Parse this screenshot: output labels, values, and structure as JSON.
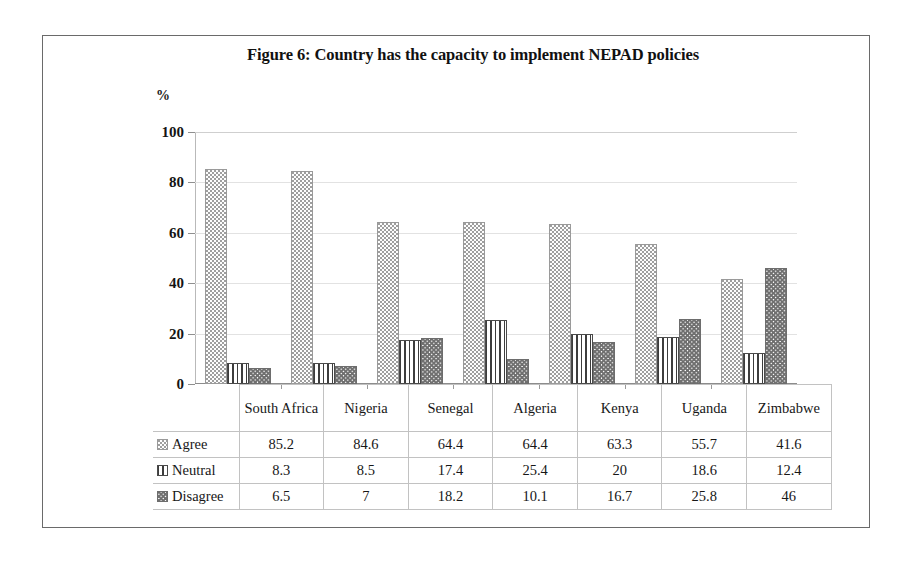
{
  "figure": {
    "title": "Figure 6: Country has the capacity to implement NEPAD policies",
    "y_axis_unit_label": "%"
  },
  "legend": {
    "items": [
      {
        "label": "Agree",
        "pattern": "stipple-dots",
        "swatch": "agree-swatch-icon"
      },
      {
        "label": "Neutral",
        "pattern": "vertical-stripes",
        "swatch": "neutral-swatch-icon"
      },
      {
        "label": "Disagree",
        "pattern": "wave-crosshatch",
        "swatch": "disagree-swatch-icon"
      }
    ]
  },
  "chart_data": {
    "type": "bar",
    "title": "Figure 6: Country has the capacity to implement NEPAD policies",
    "xlabel": "",
    "ylabel": "%",
    "ylim": [
      0,
      100
    ],
    "yticks": [
      0,
      20,
      40,
      60,
      80,
      100
    ],
    "grid": true,
    "legend_position": "table-row-headers",
    "categories": [
      "South Africa",
      "Nigeria",
      "Senegal",
      "Algeria",
      "Kenya",
      "Uganda",
      "Zimbabwe"
    ],
    "series": [
      {
        "name": "Agree",
        "values": [
          85.2,
          84.6,
          64.4,
          64.4,
          63.3,
          55.7,
          41.6
        ]
      },
      {
        "name": "Neutral",
        "values": [
          8.3,
          8.5,
          17.4,
          25.4,
          20,
          18.6,
          12.4
        ]
      },
      {
        "name": "Disagree",
        "values": [
          6.5,
          7,
          18.2,
          10.1,
          16.7,
          25.8,
          46
        ]
      }
    ]
  },
  "table": {
    "corner": "",
    "columns": [
      "South Africa",
      "Nigeria",
      "Senegal",
      "Algeria",
      "Kenya",
      "Uganda",
      "Zimbabwe"
    ],
    "rows": [
      {
        "label": "Agree",
        "cells": [
          "85.2",
          "84.6",
          "64.4",
          "64.4",
          "63.3",
          "55.7",
          "41.6"
        ]
      },
      {
        "label": "Neutral",
        "cells": [
          "8.3",
          "8.5",
          "17.4",
          "25.4",
          "20",
          "18.6",
          "12.4"
        ]
      },
      {
        "label": "Disagree",
        "cells": [
          "6.5",
          "7",
          "18.2",
          "10.1",
          "16.7",
          "25.8",
          "46"
        ]
      }
    ]
  },
  "colors": {
    "frame": "#6a6a6a",
    "gridline": "#e2e2e2",
    "axis": "#8c8c8c",
    "text": "#141414",
    "background": "#ffffff"
  }
}
